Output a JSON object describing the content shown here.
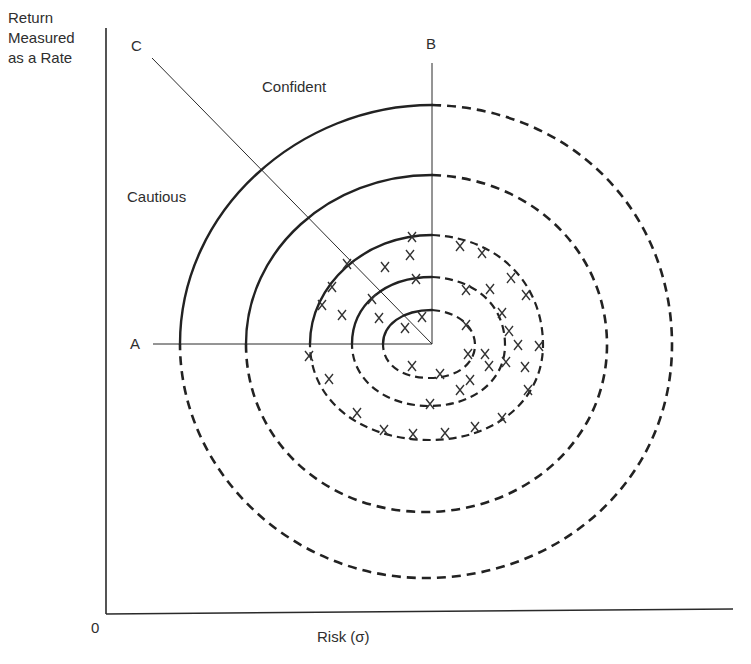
{
  "figure": {
    "type": "risk-return diagram",
    "y_axis_label": [
      "Return",
      "Measured",
      "as a Rate"
    ],
    "x_axis_label": "Risk (σ)",
    "origin_label": "0",
    "region_labels": {
      "confident": "Confident",
      "cautious": "Cautious"
    },
    "reference_lines": [
      {
        "id": "A",
        "label": "A",
        "direction": "horizontal, left of center"
      },
      {
        "id": "B",
        "label": "B",
        "direction": "vertical, above center"
      },
      {
        "id": "C",
        "label": "C",
        "direction": "diagonal, upper-left of center"
      }
    ],
    "rings": {
      "count": 5,
      "upper_left_quadrant_style": "solid",
      "other_quadrants_style": "dashed",
      "note": "Concentric indifference contours around a common center; solid in the quadrant between lines A and B, dashed elsewhere"
    },
    "markers": {
      "symbol": "x",
      "description": "Scattered x marks placed on and between the three innermost rings"
    }
  },
  "colors": {
    "ink": "#2a2a2a",
    "background": "#ffffff"
  }
}
